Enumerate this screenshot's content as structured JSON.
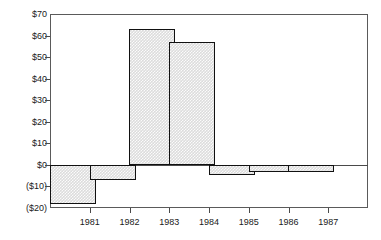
{
  "chart_data": {
    "type": "bar",
    "title": "",
    "subtitle": "",
    "xlabel": "",
    "ylabel": "",
    "categories": [
      "1981",
      "1982",
      "1983",
      "1984",
      "1985",
      "1986",
      "1987"
    ],
    "values": [
      -18,
      -7,
      63,
      57,
      -4.5,
      -3.5,
      -3.5
    ],
    "series": [
      {
        "name": "",
        "values": [
          -18,
          -7,
          63,
          57,
          -4.5,
          -3.5,
          -3.5
        ]
      }
    ],
    "ylim": [
      -20,
      70
    ],
    "ytick_values": [
      70,
      60,
      50,
      40,
      30,
      20,
      10,
      0,
      -10,
      -20
    ],
    "ytick_labels": [
      "$70",
      "$60",
      "$50",
      "$40",
      "$30",
      "$20",
      "$10",
      "$0",
      "($10)",
      "($20)"
    ],
    "xtick_labels": [
      "1981",
      "1982",
      "1983",
      "1984",
      "1985",
      "1986",
      "1987"
    ],
    "grid": false,
    "legend": false,
    "legend_position": "none",
    "zero_line": true,
    "annotations": [],
    "colors": {
      "bar_fill": "#dcdcdc",
      "bar_edge": "#111111",
      "axis": "#4a4a4a",
      "frame": "#5a5a5a",
      "text": "#1a1a1a",
      "background": "#ffffff"
    }
  }
}
